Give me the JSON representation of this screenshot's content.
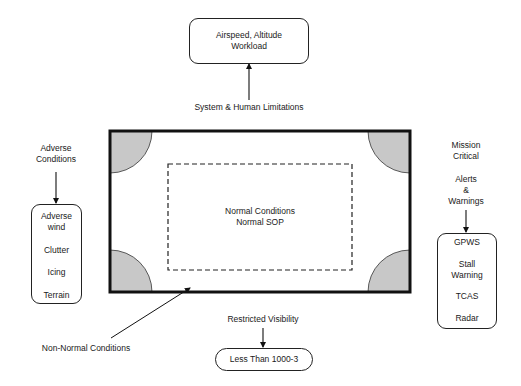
{
  "diagram": {
    "top_box": {
      "line1": "Airspeed, Altitude",
      "line2": "Workload"
    },
    "top_label": "System & Human Limitations",
    "center": {
      "line1": "Normal Conditions",
      "line2": "Normal SOP"
    },
    "left_label": {
      "line1": "Adverse",
      "line2": "Conditions"
    },
    "left_box": {
      "items": [
        "Adverse wind",
        "Clutter",
        "Icing",
        "Terrain"
      ],
      "item0_line1": "Adverse",
      "item0_line2": "wind",
      "item1": "Clutter",
      "item2": "Icing",
      "item3": "Terrain"
    },
    "right_label": {
      "line1": "Mission",
      "line2": "Critical",
      "line3": "Alerts",
      "line4": "&",
      "line5": "Warnings"
    },
    "right_box": {
      "items": [
        "GPWS",
        "Stall Warning",
        "TCAS",
        "Radar"
      ],
      "item0": "GPWS",
      "item1_line1": "Stall",
      "item1_line2": "Warning",
      "item2": "TCAS",
      "item3": "Radar"
    },
    "bottom_label": "Restricted Visibility",
    "bottom_box": "Less Than 1000-3",
    "non_normal_label": "Non-Normal Conditions",
    "colors": {
      "stroke": "#111111",
      "corner_fill": "#c8c8c8",
      "background": "#ffffff",
      "text": "#1a1a1a"
    }
  }
}
